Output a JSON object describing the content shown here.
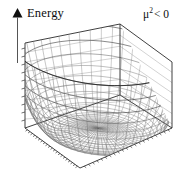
{
  "figure": {
    "type": "surface-3d",
    "yaxis": {
      "label": "Energy",
      "arrow": "up-arrow-icon"
    },
    "annotation": {
      "base": "μ",
      "exponent": "2",
      "relation": "< 0",
      "full": "μ² < 0"
    },
    "colors": {
      "background": "#ffffff",
      "ink": "#111111",
      "frame": "#2b2b2b",
      "grid": "#9a9a9a",
      "mesh": "#4a4a4a",
      "mesh_light": "#8d8d8d"
    }
  },
  "chart_data": {
    "type": "surface",
    "title": "",
    "subtitle": "",
    "xlabel": "",
    "ylabel": "",
    "zlabel": "Energy",
    "annotations": [
      "μ² < 0"
    ],
    "legend": [],
    "grid": true,
    "potential": "V(r) = mu2 * r^2 + lambda * r^4",
    "parameters": {
      "mu2": -1.0,
      "lambda": 1.0
    },
    "minimum_radius": 0.707,
    "central_maximum": 0.0,
    "xlim": [
      -1.6,
      1.6
    ],
    "ylim": [
      -1.6,
      1.6
    ],
    "zlim": [
      -0.25,
      3.2
    ],
    "mesh_lines_u": 44,
    "mesh_lines_v": 44,
    "tick_marks": {
      "vertical_axis": 11,
      "base_front_left": 22,
      "base_front_right": 22
    },
    "gridlines_back_wall": 9,
    "shape": "rotationally symmetric double-well; central bump at r=0, circular trough of degenerate minima, walls rising to the box corners"
  }
}
